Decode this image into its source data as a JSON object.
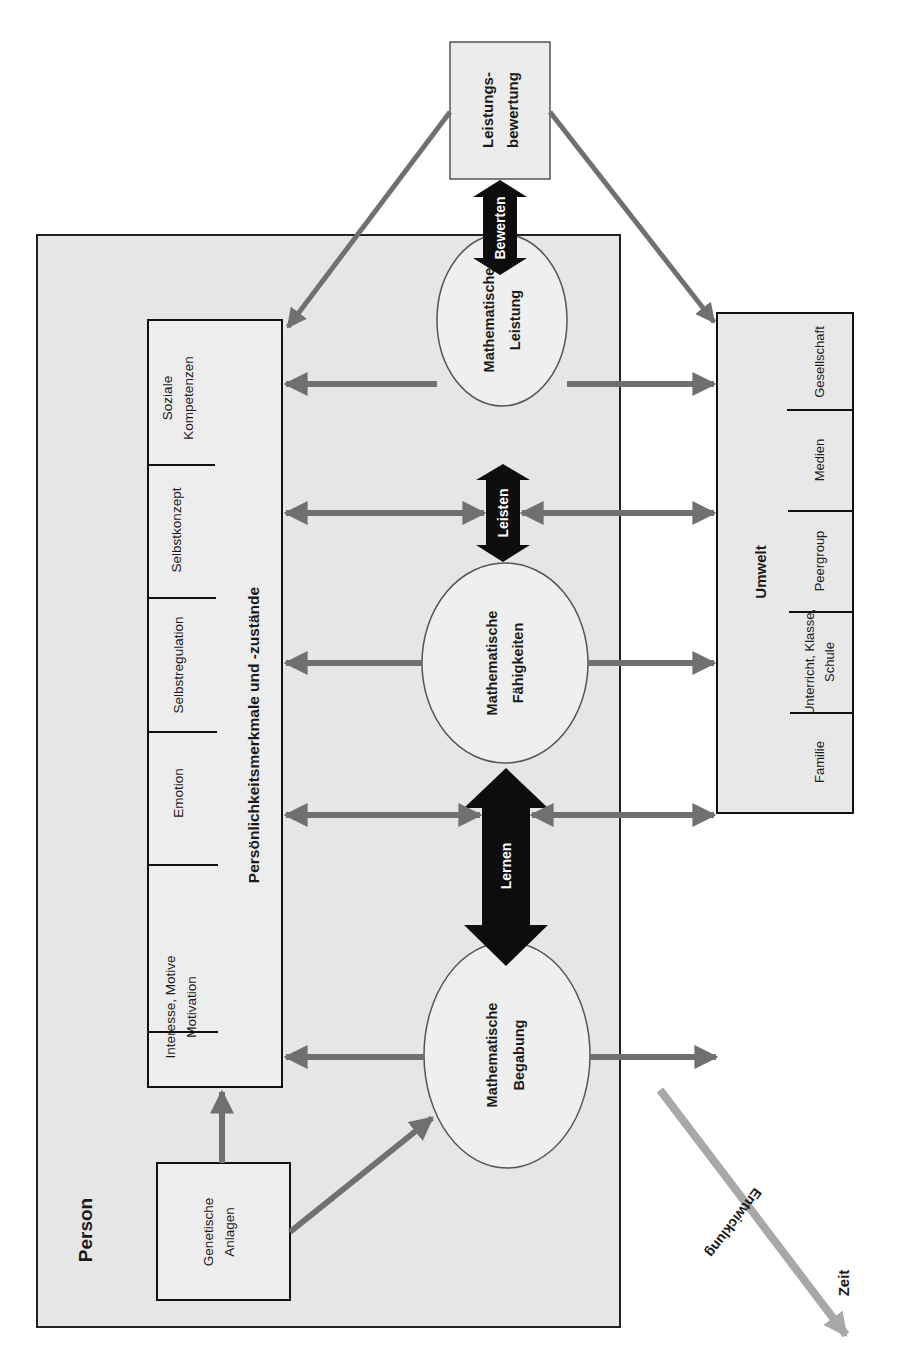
{
  "figure": {
    "orientation": "rotated-90-ccw",
    "colors": {
      "background": "#ffffff",
      "box_fill": "#e6e6e6",
      "inner_fill": "#ededed",
      "ellipse_fill": "#efefef",
      "border": "#222222",
      "gray_arrow": "#707070",
      "black_arrow": "#0d0d0d",
      "time_arrow": "#a8a8a8"
    }
  },
  "person": {
    "title": "Person",
    "personality": {
      "title": "Persönlichkeitsmerkmale und -zustände",
      "items": [
        {
          "line1": "Interesse, Motive",
          "line2": "Motivation"
        },
        {
          "line1": "Emotion",
          "line2": ""
        },
        {
          "line1": "Selbstregulation",
          "line2": ""
        },
        {
          "line1": "Selbstkonzept",
          "line2": ""
        },
        {
          "line1": "Soziale",
          "line2": "Kompetenzen"
        }
      ]
    },
    "genetics": {
      "line1": "Genetische",
      "line2": "Anlagen"
    }
  },
  "ellipses": {
    "begabung": {
      "line1": "Mathematische",
      "line2": "Begabung"
    },
    "faehigkeiten": {
      "line1": "Mathematische",
      "line2": "Fähigkeiten"
    },
    "leistung": {
      "line1": "Mathematische",
      "line2": "Leistung"
    }
  },
  "process_arrows": {
    "lernen": "Lernen",
    "leisten": "Leisten",
    "bewerten": "Bewerten"
  },
  "evaluation": {
    "line1": "Leistungs-",
    "line2": "bewertung"
  },
  "environment": {
    "title": "Umwelt",
    "items": [
      {
        "line1": "Familie",
        "line2": ""
      },
      {
        "line1": "Unterricht, Klasse,",
        "line2": "Schule"
      },
      {
        "line1": "Peergroup",
        "line2": ""
      },
      {
        "line1": "Medien",
        "line2": ""
      },
      {
        "line1": "Gesellschaft",
        "line2": ""
      }
    ]
  },
  "time_axis": {
    "label_development": "Entwicklung",
    "label_time": "Zeit"
  }
}
